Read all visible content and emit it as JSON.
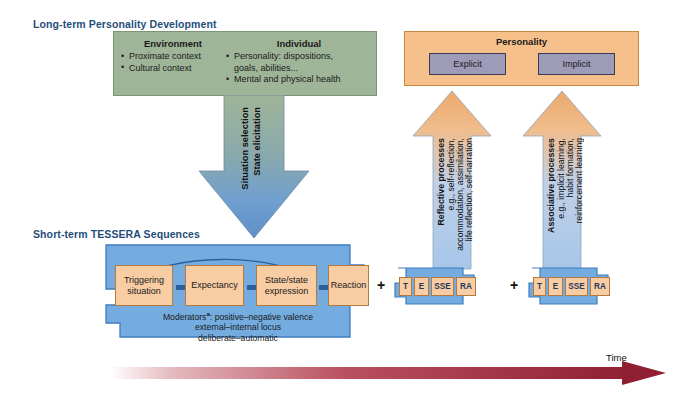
{
  "titles": {
    "long_term": "Long-term Personality Development",
    "short_term": "Short-term TESSERA Sequences"
  },
  "long_term_box": {
    "columns": [
      {
        "heading": "Environment",
        "items": [
          [
            "Proximate context"
          ],
          [
            "Cultural context"
          ]
        ]
      },
      {
        "heading": "Individual",
        "items": [
          [
            "Personality: dispositions,",
            "goals, abilities..."
          ],
          [
            "Mental and physical health"
          ]
        ]
      }
    ]
  },
  "down_arrow": {
    "line1": "Situation selection",
    "line2": "State elicitation"
  },
  "personality_box": {
    "title": "Personality",
    "explicit": "Explicit",
    "implicit": "Implicit"
  },
  "up_arrows": [
    {
      "name": "reflective",
      "heading": "Reflective processes",
      "lines": [
        "e.g., self-reflection,",
        "accommodation, assimilation,",
        "life reflection, self-narration"
      ]
    },
    {
      "name": "associative",
      "heading": "Associative processes",
      "lines": [
        "e.g., implicit learning,",
        "habit formation,",
        "reinforcement learning"
      ]
    }
  ],
  "tessera_sequence": {
    "boxes": [
      {
        "l1": "Triggering",
        "l2": "situation"
      },
      {
        "l1": "Expectancy",
        "l2": ""
      },
      {
        "l1": "State/state",
        "l2": "expression"
      },
      {
        "l1": "Reaction",
        "l2": ""
      }
    ],
    "moderators_label": "Moderators",
    "moderators_sup": "a",
    "moderators_sep": ": ",
    "moderators": [
      "positive–negative valence",
      "external–internal locus",
      "deliberate–automatic"
    ]
  },
  "plus_signs": {
    "first": "+",
    "second": "+"
  },
  "mini_sequences": [
    {
      "letters": [
        "T",
        "E",
        "SSE",
        "RA"
      ]
    },
    {
      "letters": [
        "T",
        "E",
        "SSE",
        "RA"
      ]
    }
  ],
  "time_axis": {
    "label": "Time"
  },
  "colors": {
    "title_blue": "#1f4e79",
    "green": "#9fb598",
    "arrow_blue": "#6f9fd0",
    "tessera_blue": "#74ace0",
    "orange": "#f6c08a",
    "seq_orange": "#f8cda4",
    "purple": "#9e9bb8",
    "time_red": "#9e2b3b"
  }
}
